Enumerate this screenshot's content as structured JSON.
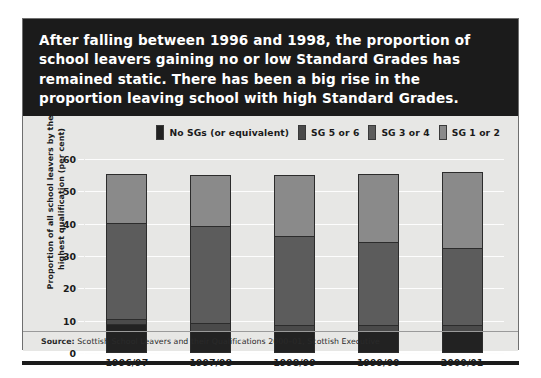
{
  "headline": "After falling between 1996 and 1998, the proportion of school leavers gaining no or low Standard Grades has remained static. There has been a big rise in the proportion leaving school with high Standard Grades.",
  "source": {
    "prefix": "Source:",
    "text": " Scottish School Leavers and their Qualifications 2000–01, Scottish Executive"
  },
  "colors": {
    "banner_background": "#1b1b1b",
    "panel_background": "#e7e7e5",
    "gridline": "#fdfdfd",
    "no_sgs": "#222222",
    "sg_5_or_6": "#4a4a4a",
    "sg_3_or_4": "#5c5c5c",
    "sg_1_or_2": "#8a8a8a",
    "bar_outline": "#2c2c2c"
  },
  "chart_data": {
    "type": "bar",
    "subtype": "stacked-vertical",
    "title": "",
    "xlabel": "",
    "ylabel": "Proportion of all school leavers by their highest qualification (per cent)",
    "ylim": [
      0,
      60
    ],
    "yticks": [
      0,
      10,
      20,
      30,
      40,
      50,
      60
    ],
    "ytick_labels": [
      "0",
      "10",
      "20",
      "30",
      "40",
      "50",
      "60"
    ],
    "grid": true,
    "legend_position": "top-right",
    "categories": [
      "1996/97",
      "1997/98",
      "1998/99",
      "1999/00",
      "2000/01"
    ],
    "series": [
      {
        "name": "No SGs (or equivalent)",
        "color": "#222222",
        "values": [
          8.5,
          6.5,
          6.5,
          6.5,
          6.5
        ]
      },
      {
        "name": "SG 5 or 6",
        "color": "#4a4a4a",
        "values": [
          1.5,
          2.0,
          1.5,
          1.5,
          1.5
        ]
      },
      {
        "name": "SG 3 or 4",
        "color": "#5c5c5c",
        "values": [
          30.0,
          30.5,
          28.0,
          26.0,
          24.0
        ]
      },
      {
        "name": "SG 1 or 2",
        "color": "#8a8a8a",
        "values": [
          15.5,
          16.0,
          19.0,
          21.5,
          24.0
        ]
      }
    ],
    "totals": [
      55.5,
      55.0,
      55.0,
      55.5,
      56.0
    ]
  }
}
